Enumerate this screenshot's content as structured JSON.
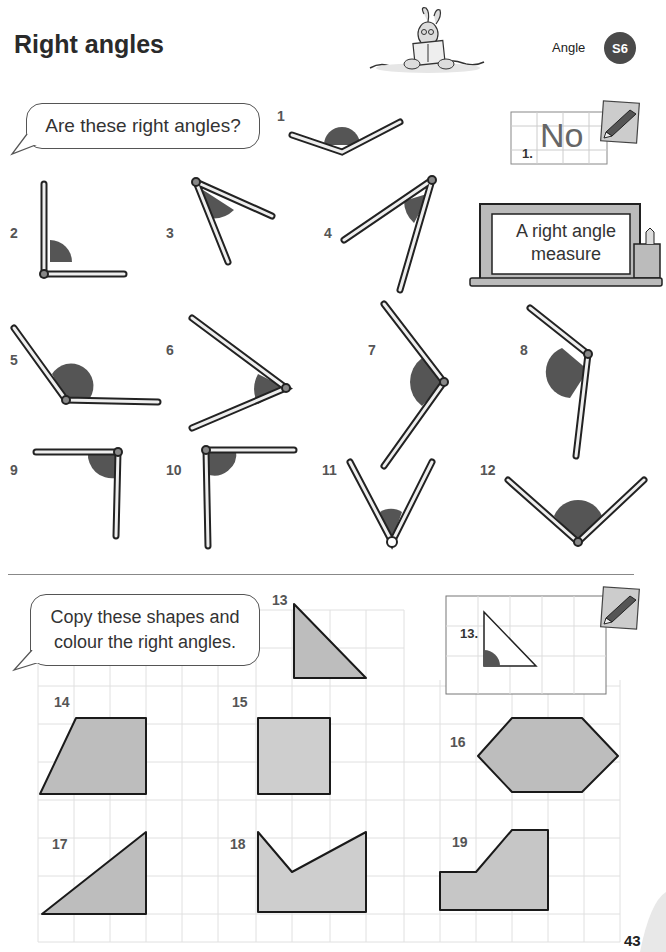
{
  "header": {
    "title": "Right angles",
    "topic": "Angle",
    "badge": "S6"
  },
  "section1": {
    "prompt": "Are these right angles?",
    "example": {
      "label": "1.",
      "answer": "No"
    },
    "tool_label_line1": "A right angle",
    "tool_label_line2": "measure",
    "items": [
      {
        "num": "1",
        "angle": "obtuse"
      },
      {
        "num": "2",
        "angle": "right"
      },
      {
        "num": "3",
        "angle": "acute"
      },
      {
        "num": "4",
        "angle": "acute"
      },
      {
        "num": "5",
        "angle": "obtuse"
      },
      {
        "num": "6",
        "angle": "acute"
      },
      {
        "num": "7",
        "angle": "right"
      },
      {
        "num": "8",
        "angle": "obtuse"
      },
      {
        "num": "9",
        "angle": "right"
      },
      {
        "num": "10",
        "angle": "right"
      },
      {
        "num": "11",
        "angle": "acute"
      },
      {
        "num": "12",
        "angle": "right"
      }
    ]
  },
  "section2": {
    "prompt_line1": "Copy these shapes and",
    "prompt_line2": "colour the right angles.",
    "example": {
      "label": "13."
    },
    "shapes": [
      {
        "num": "13",
        "shape": "right triangle"
      },
      {
        "num": "14",
        "shape": "right trapezium"
      },
      {
        "num": "15",
        "shape": "rectangle"
      },
      {
        "num": "16",
        "shape": "hexagon"
      },
      {
        "num": "17",
        "shape": "right triangle"
      },
      {
        "num": "18",
        "shape": "concave pentagon"
      },
      {
        "num": "19",
        "shape": "L-shaped pentagon"
      }
    ]
  },
  "footer": {
    "page_number": "43"
  },
  "colors": {
    "badge": "#4a4a4a",
    "shape_fill": "#bdbdbd",
    "angle_mark": "#555555",
    "grid": "#dddddd"
  }
}
